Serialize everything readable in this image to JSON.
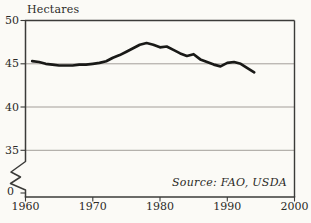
{
  "chart_data": {
    "type": "line",
    "y_axis_title": "Hectares",
    "source_annotation": "Source: FAO, USDA",
    "xlabel": "",
    "ylabel": "Hectares (millions)",
    "x": [
      1961,
      1962,
      1963,
      1964,
      1965,
      1966,
      1967,
      1968,
      1969,
      1970,
      1971,
      1972,
      1973,
      1974,
      1975,
      1976,
      1977,
      1978,
      1979,
      1980,
      1981,
      1982,
      1983,
      1984,
      1985,
      1986,
      1987,
      1988,
      1989,
      1990,
      1991,
      1992,
      1993,
      1994
    ],
    "values": [
      45.3,
      45.2,
      45.0,
      44.9,
      44.8,
      44.8,
      44.8,
      44.9,
      44.9,
      45.0,
      45.1,
      45.3,
      45.7,
      46.0,
      46.4,
      46.8,
      47.2,
      47.4,
      47.2,
      46.9,
      47.0,
      46.6,
      46.2,
      45.9,
      46.1,
      45.5,
      45.2,
      44.9,
      44.7,
      45.1,
      45.2,
      45.0,
      44.5,
      44.0
    ],
    "x_ticks": [
      {
        "label": "1960",
        "value": 1960
      },
      {
        "label": "1970",
        "value": 1970
      },
      {
        "label": "1980",
        "value": 1980
      },
      {
        "label": "1990",
        "value": 1990
      },
      {
        "label": "2000",
        "value": 2000
      }
    ],
    "y_ticks": [
      {
        "label": "50",
        "value": 50
      },
      {
        "label": "45",
        "value": 45
      },
      {
        "label": "40",
        "value": 40
      },
      {
        "label": "35",
        "value": 35
      },
      {
        "label": "0",
        "value": 0
      }
    ],
    "xlim": [
      1960,
      2000
    ],
    "ylim": [
      0,
      50
    ],
    "ylim_display": [
      35,
      50
    ],
    "y_axis_break": true,
    "grid_values": [
      45,
      40,
      35
    ],
    "grid": "horizontal",
    "legend": "none",
    "colors": {
      "line": "#191917",
      "axis": "#3b3b39",
      "grid": "#98948e",
      "background": "#fbfaf6",
      "text": "#2b2a27"
    }
  }
}
